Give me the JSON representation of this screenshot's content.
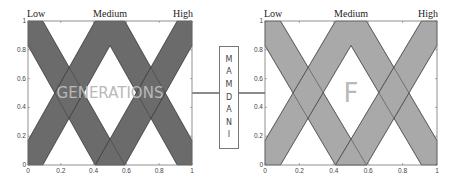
{
  "left_plot": {
    "watermark": "GENERATIONS",
    "fill_color": "#6b6b6b",
    "labels": {
      "low": "Low",
      "medium": "Medium",
      "high": "High"
    },
    "x_ticks": [
      "0",
      "0.2",
      "0.4",
      "0.6",
      "0.8",
      "1"
    ],
    "y_ticks": [
      "0",
      "0.2",
      "0.4",
      "0.6",
      "0.8",
      "1"
    ]
  },
  "right_plot": {
    "watermark": "F",
    "fill_color": "#a9a9a9",
    "labels": {
      "low": "Low",
      "medium": "Medium",
      "high": "High"
    },
    "x_ticks": [
      "0",
      "0.2",
      "0.4",
      "0.6",
      "0.8",
      "1"
    ],
    "y_ticks": [
      "0",
      "0.2",
      "0.4",
      "0.6",
      "0.8",
      "1"
    ]
  },
  "inference_box": {
    "label": "MAMDANI",
    "letters": [
      "M",
      "A",
      "M",
      "D",
      "A",
      "N",
      "I"
    ]
  },
  "membership_functions": {
    "low": [
      [
        0,
        1
      ],
      [
        0.09,
        1
      ],
      [
        0.59,
        0
      ],
      [
        0.41,
        0
      ],
      [
        0,
        0.83
      ]
    ],
    "medium_upper": [
      [
        0,
        0.17
      ],
      [
        0.41,
        1
      ],
      [
        0.59,
        1
      ],
      [
        1,
        0.17
      ],
      [
        1,
        0
      ],
      [
        0.91,
        0
      ],
      [
        0.5,
        0.83
      ],
      [
        0.09,
        0
      ],
      [
        0,
        0
      ]
    ],
    "high": [
      [
        1,
        1
      ],
      [
        0.91,
        1
      ],
      [
        0.41,
        0
      ],
      [
        0.59,
        0
      ],
      [
        1,
        0.83
      ]
    ]
  }
}
